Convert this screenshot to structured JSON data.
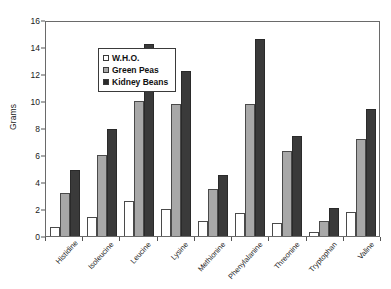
{
  "chart_data": {
    "type": "bar",
    "title": "",
    "xlabel": "",
    "ylabel": "Grams",
    "ylim": [
      0,
      16
    ],
    "yticks": [
      0,
      2,
      4,
      6,
      8,
      10,
      12,
      14,
      16
    ],
    "grid": false,
    "legend_position": "top-left",
    "categories": [
      "Histidine",
      "Isoleucine",
      "Leucine",
      "Lysine",
      "Methionine",
      "Phenylalanine",
      "Threonine",
      "Tryptophan",
      "Valine"
    ],
    "series": [
      {
        "name": "W.H.O.",
        "color": "#ffffff",
        "values": [
          0.7,
          1.4,
          2.6,
          2.0,
          1.1,
          1.7,
          1.0,
          0.3,
          1.8
        ]
      },
      {
        "name": "Green Peas",
        "color": "#a8a8a8",
        "values": [
          3.2,
          6.0,
          10.0,
          9.8,
          3.5,
          9.8,
          6.3,
          1.1,
          7.2
        ]
      },
      {
        "name": "Kidney Beans",
        "color": "#2a2a2a",
        "values": [
          4.9,
          7.9,
          14.2,
          12.2,
          4.5,
          14.6,
          7.4,
          2.1,
          9.4
        ]
      }
    ]
  },
  "axes": {
    "y_title": "Grams"
  }
}
